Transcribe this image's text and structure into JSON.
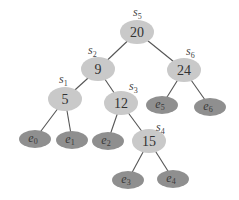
{
  "colors": {
    "internal_fill": "#c9c9c9",
    "leaf_fill": "#8f8f8f",
    "edge": "#555555",
    "background": "#ffffff"
  },
  "internal_nodes": [
    {
      "id": "n20",
      "key": "20",
      "label_base": "s",
      "label_sub": "5",
      "cx": 137,
      "cy": 32,
      "lx": 133,
      "ly": 16
    },
    {
      "id": "n9",
      "key": "9",
      "label_base": "s",
      "label_sub": "2",
      "cx": 98,
      "cy": 69,
      "lx": 88,
      "ly": 54
    },
    {
      "id": "n24",
      "key": "24",
      "label_base": "s",
      "label_sub": "6",
      "cx": 184,
      "cy": 70,
      "lx": 186,
      "ly": 55
    },
    {
      "id": "n5",
      "key": "5",
      "label_base": "s",
      "label_sub": "1",
      "cx": 65,
      "cy": 99,
      "lx": 59,
      "ly": 83
    },
    {
      "id": "n12",
      "key": "12",
      "label_base": "s",
      "label_sub": "3",
      "cx": 121,
      "cy": 103,
      "lx": 129,
      "ly": 90
    },
    {
      "id": "n15",
      "key": "15",
      "label_base": "s",
      "label_sub": "4",
      "cx": 149,
      "cy": 141,
      "lx": 156,
      "ly": 131
    }
  ],
  "leaves": [
    {
      "id": "e0",
      "base": "e",
      "sub": "0",
      "cx": 35,
      "cy": 139
    },
    {
      "id": "e1",
      "base": "e",
      "sub": "1",
      "cx": 72,
      "cy": 140
    },
    {
      "id": "e2",
      "base": "e",
      "sub": "2",
      "cx": 108,
      "cy": 141
    },
    {
      "id": "e3",
      "base": "e",
      "sub": "3",
      "cx": 128,
      "cy": 180
    },
    {
      "id": "e4",
      "base": "e",
      "sub": "4",
      "cx": 173,
      "cy": 179
    },
    {
      "id": "e5",
      "base": "e",
      "sub": "5",
      "cx": 162,
      "cy": 105
    },
    {
      "id": "e6",
      "base": "e",
      "sub": "6",
      "cx": 210,
      "cy": 107
    }
  ],
  "edges": [
    [
      "n20",
      "n9"
    ],
    [
      "n20",
      "n24"
    ],
    [
      "n9",
      "n5"
    ],
    [
      "n9",
      "n12"
    ],
    [
      "n24",
      "e5"
    ],
    [
      "n24",
      "e6"
    ],
    [
      "n5",
      "e0"
    ],
    [
      "n5",
      "e1"
    ],
    [
      "n12",
      "e2"
    ],
    [
      "n12",
      "n15"
    ],
    [
      "n15",
      "e3"
    ],
    [
      "n15",
      "e4"
    ]
  ]
}
